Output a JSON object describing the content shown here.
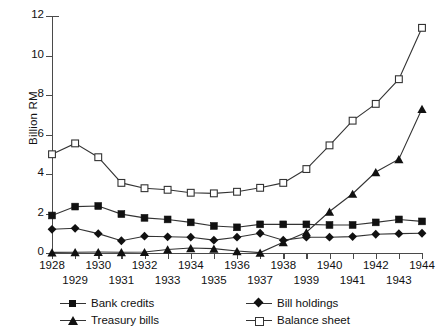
{
  "axes": {
    "ylabel": "Billion RM",
    "yticks": [
      0,
      2,
      4,
      6,
      8,
      10,
      12
    ],
    "xticks": [
      1928,
      1929,
      1930,
      1931,
      1932,
      1933,
      1934,
      1935,
      1936,
      1937,
      1938,
      1939,
      1940,
      1941,
      1942,
      1943,
      1944
    ]
  },
  "legend": {
    "items": [
      {
        "label": "Bank credits",
        "marker": "filled-square"
      },
      {
        "label": "Bill holdings",
        "marker": "filled-diamond"
      },
      {
        "label": "Treasury bills",
        "marker": "filled-triangle"
      },
      {
        "label": "Balance sheet",
        "marker": "open-square"
      }
    ]
  },
  "chart_data": {
    "type": "line",
    "title": "",
    "xlabel": "",
    "ylabel": "Billion RM",
    "xlim": [
      1928,
      1944
    ],
    "ylim": [
      0,
      12
    ],
    "grid": false,
    "legend_position": "bottom",
    "x": [
      1928,
      1929,
      1930,
      1931,
      1932,
      1933,
      1934,
      1935,
      1936,
      1937,
      1938,
      1939,
      1940,
      1941,
      1942,
      1943,
      1944
    ],
    "series": [
      {
        "name": "Bank credits",
        "marker": "filled-square",
        "values": [
          1.9,
          2.35,
          2.38,
          1.97,
          1.78,
          1.7,
          1.55,
          1.37,
          1.3,
          1.45,
          1.45,
          1.45,
          1.42,
          1.42,
          1.55,
          1.7,
          1.6
        ]
      },
      {
        "name": "Treasury bills",
        "marker": "filled-triangle",
        "values": [
          0.03,
          0.04,
          0.05,
          0.04,
          0.05,
          0.18,
          0.25,
          0.22,
          0.1,
          0.02,
          0.55,
          1.05,
          2.1,
          3.0,
          4.1,
          4.75,
          7.3
        ]
      },
      {
        "name": "Bill holdings",
        "marker": "filled-diamond",
        "values": [
          1.2,
          1.25,
          0.98,
          0.62,
          0.85,
          0.82,
          0.8,
          0.65,
          0.8,
          1.0,
          0.65,
          0.8,
          0.8,
          0.83,
          0.95,
          0.98,
          1.0
        ]
      },
      {
        "name": "Balance sheet",
        "marker": "open-square",
        "values": [
          5.0,
          5.55,
          4.85,
          3.55,
          3.28,
          3.2,
          3.05,
          3.02,
          3.1,
          3.3,
          3.55,
          4.25,
          5.45,
          6.7,
          7.55,
          8.8,
          11.4
        ]
      }
    ]
  }
}
